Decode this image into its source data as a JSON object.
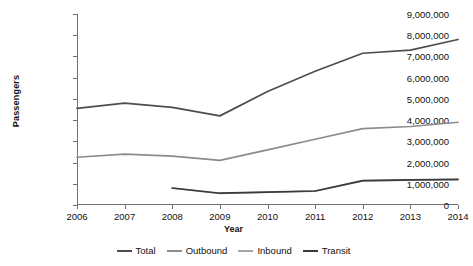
{
  "chart_data": {
    "type": "line",
    "title": "",
    "xlabel": "Year",
    "ylabel": "Passengers",
    "x": [
      2006,
      2007,
      2008,
      2009,
      2010,
      2011,
      2012,
      2013,
      2014
    ],
    "xtick_labels": [
      "2006",
      "2007",
      "2008",
      "2009",
      "2010",
      "2011",
      "2012",
      "2013",
      "2014"
    ],
    "ytick_labels": [
      "0",
      "1,000,000",
      "2,000,000",
      "3,000,000",
      "4,000,000",
      "5,000,000",
      "6,000,000",
      "7,000,000",
      "8,000,000",
      "9,000,000"
    ],
    "ytick_values": [
      0,
      1000000,
      2000000,
      3000000,
      4000000,
      5000000,
      6000000,
      7000000,
      8000000,
      9000000
    ],
    "ylim": [
      0,
      9000000
    ],
    "xlim": [
      2006,
      2014
    ],
    "grid": false,
    "legend_position": "bottom",
    "series": [
      {
        "name": "Total",
        "color": "#4d4d4d",
        "x": [
          2006,
          2007,
          2008,
          2009,
          2010,
          2011,
          2012,
          2013,
          2014
        ],
        "values": [
          4550000,
          4800000,
          4600000,
          4200000,
          5350000,
          6300000,
          7150000,
          7300000,
          7800000
        ]
      },
      {
        "name": "Outbound",
        "color": "#8c8c8c",
        "x": [
          2006,
          2007,
          2008,
          2009,
          2010,
          2011,
          2012,
          2013,
          2014
        ],
        "values": [
          2250000,
          2400000,
          2300000,
          2100000,
          2600000,
          3100000,
          3600000,
          3700000,
          3900000
        ]
      },
      {
        "name": "Inbound",
        "color": "#a6a6a6",
        "x": [
          2008,
          2009,
          2010,
          2011,
          2012,
          2013,
          2014
        ],
        "values": [
          790000,
          545000,
          600000,
          650000,
          1140000,
          1170000,
          1200000
        ]
      },
      {
        "name": "Transit",
        "color": "#3a3a3a",
        "x": [
          2008,
          2009,
          2010,
          2011,
          2012,
          2013,
          2014
        ],
        "values": [
          800000,
          555000,
          610000,
          660000,
          1150000,
          1180000,
          1210000
        ]
      }
    ]
  },
  "legend": {
    "items": [
      {
        "label": "Total",
        "color": "#4d4d4d"
      },
      {
        "label": "Outbound",
        "color": "#8c8c8c"
      },
      {
        "label": "Inbound",
        "color": "#a6a6a6"
      },
      {
        "label": "Transit",
        "color": "#3a3a3a"
      }
    ]
  }
}
